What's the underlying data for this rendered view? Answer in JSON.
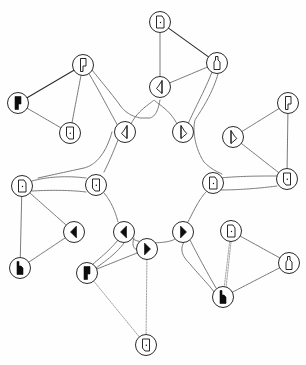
{
  "diagram": {
    "type": "network-graph",
    "colors": {
      "background": "#fefefe",
      "node_ring": "#2a2a2a",
      "glyph": "#111111",
      "edge": "#6a6a6a"
    },
    "node_radius": 10.5,
    "nodes": [
      {
        "id": "hex-ul",
        "x": 125,
        "y": 132,
        "glyph": "hatched-triangle-left"
      },
      {
        "id": "hex-ur",
        "x": 183,
        "y": 132,
        "glyph": "hatched-triangle-right"
      },
      {
        "id": "hex-r",
        "x": 213,
        "y": 183,
        "glyph": "door-dot-right"
      },
      {
        "id": "hex-lr",
        "x": 183,
        "y": 232,
        "glyph": "filled-triangle-right"
      },
      {
        "id": "hex-ll",
        "x": 124,
        "y": 232,
        "glyph": "filled-triangle-left"
      },
      {
        "id": "hex-l",
        "x": 96,
        "y": 185,
        "glyph": "door-dot-left"
      },
      {
        "id": "top-a",
        "x": 160,
        "y": 22,
        "glyph": "door-dot-right"
      },
      {
        "id": "top-b",
        "x": 160,
        "y": 87,
        "glyph": "hatched-triangle-left"
      },
      {
        "id": "top-c",
        "x": 217,
        "y": 63,
        "glyph": "hatched-bottle"
      },
      {
        "id": "ur-a",
        "x": 288,
        "y": 103,
        "glyph": "hatched-bar"
      },
      {
        "id": "ur-b",
        "x": 233,
        "y": 137,
        "glyph": "hatched-triangle-right"
      },
      {
        "id": "ur-c",
        "x": 287,
        "y": 179,
        "glyph": "door-dot-left"
      },
      {
        "id": "lr-a",
        "x": 231,
        "y": 231,
        "glyph": "door-dot-right"
      },
      {
        "id": "lr-b",
        "x": 289,
        "y": 263,
        "glyph": "hatched-bottle"
      },
      {
        "id": "lr-c",
        "x": 223,
        "y": 297,
        "glyph": "filled-bottle"
      },
      {
        "id": "bot-a",
        "x": 87,
        "y": 273,
        "glyph": "filled-bar"
      },
      {
        "id": "bot-b",
        "x": 147,
        "y": 249,
        "glyph": "filled-triangle-right"
      },
      {
        "id": "bot-c",
        "x": 146,
        "y": 345,
        "glyph": "door-dot-left"
      },
      {
        "id": "ll-a",
        "x": 22,
        "y": 186,
        "glyph": "door-dot-right"
      },
      {
        "id": "ll-b",
        "x": 74,
        "y": 232,
        "glyph": "filled-triangle-left"
      },
      {
        "id": "ll-c",
        "x": 20,
        "y": 268,
        "glyph": "filled-bottle"
      },
      {
        "id": "ul-a",
        "x": 83,
        "y": 65,
        "glyph": "hatched-bar"
      },
      {
        "id": "ul-b",
        "x": 18,
        "y": 103,
        "glyph": "filled-bar"
      },
      {
        "id": "ul-c",
        "x": 70,
        "y": 133,
        "glyph": "door-dot-left"
      }
    ],
    "edges": [
      {
        "from": "top-a",
        "to": "top-c",
        "style": "solid"
      },
      {
        "from": "top-a",
        "to": "top-b",
        "style": "dashed"
      },
      {
        "from": "top-b",
        "to": "top-c",
        "style": "dashed"
      },
      {
        "from": "ur-a",
        "to": "ur-b",
        "style": "dashed"
      },
      {
        "from": "ur-a",
        "to": "ur-c",
        "style": "dashed"
      },
      {
        "from": "ur-b",
        "to": "ur-c",
        "style": "dashed"
      },
      {
        "from": "lr-a",
        "to": "lr-b",
        "style": "dashed"
      },
      {
        "from": "lr-a",
        "to": "lr-c",
        "style": "faint"
      },
      {
        "from": "lr-b",
        "to": "lr-c",
        "style": "dashed"
      },
      {
        "from": "bot-a",
        "to": "bot-b",
        "style": "dashed"
      },
      {
        "from": "bot-a",
        "to": "bot-c",
        "style": "faint"
      },
      {
        "from": "bot-b",
        "to": "bot-c",
        "style": "faint"
      },
      {
        "from": "ll-a",
        "to": "ll-b",
        "style": "dashed"
      },
      {
        "from": "ll-a",
        "to": "ll-c",
        "style": "dashed"
      },
      {
        "from": "ll-b",
        "to": "ll-c",
        "style": "dashed"
      },
      {
        "from": "ul-a",
        "to": "ul-b",
        "style": "solid"
      },
      {
        "from": "ul-b",
        "to": "ul-c",
        "style": "dashed"
      },
      {
        "from": "ul-a",
        "to": "ul-c",
        "style": "dashed"
      }
    ]
  }
}
